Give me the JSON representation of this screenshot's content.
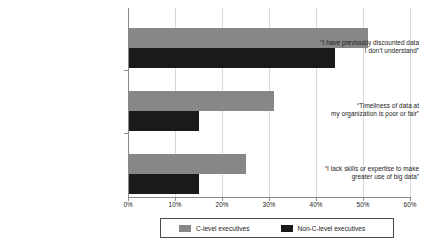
{
  "chart_data": {
    "type": "bar",
    "orientation": "horizontal",
    "title": "",
    "subtitle": "",
    "xlabel": "",
    "ylabel": "",
    "xlim": [
      0,
      60
    ],
    "xticks": [
      "0%",
      "10%",
      "20%",
      "30%",
      "40%",
      "50%",
      "60%"
    ],
    "xtick_values": [
      0,
      10,
      20,
      30,
      40,
      50,
      60
    ],
    "grid": true,
    "grid_axis": "x",
    "legend_position": "bottom-center",
    "categories": [
      "“I have previously discounted data I don’t understand”",
      "“Timeliness of data at my organization is poor or fair”",
      "“I lack skills or expertise to make greater use of big data”"
    ],
    "category_lines": [
      [
        "“I have previously discounted data",
        "I don’t understand”"
      ],
      [
        "“Timeliness of data at",
        "my organization is poor or fair”"
      ],
      [
        "“I lack skills or expertise to make",
        "greater use of big data”"
      ]
    ],
    "series": [
      {
        "name": "C-level executives",
        "color": "#878787",
        "values": [
          51,
          31,
          25
        ]
      },
      {
        "name": "Non-C-level executives",
        "color": "#1a1a1a",
        "values": [
          44,
          15,
          15
        ]
      }
    ]
  },
  "legend": {
    "entries": [
      {
        "label": "C-level executives"
      },
      {
        "label": "Non-C-level executives"
      }
    ]
  },
  "colors": {
    "series_a": "#878787",
    "series_b": "#1a1a1a",
    "axis": "#8a8a8a",
    "gridline": "#d8d8d8",
    "text": "#1a1a1a",
    "background": "#ffffff"
  }
}
